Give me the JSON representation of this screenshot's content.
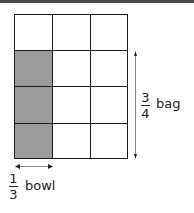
{
  "diagram": {
    "grid": {
      "rows": 4,
      "cols": 3,
      "shaded_cells": [
        [
          1,
          0
        ],
        [
          2,
          0
        ],
        [
          3,
          0
        ]
      ],
      "shade_color": "#9b9b9b",
      "line_color": "#1a1a1a"
    },
    "vertical_label": {
      "numerator": "3",
      "denominator": "4",
      "unit": "bag"
    },
    "horizontal_label": {
      "numerator": "1",
      "denominator": "3",
      "unit": "bowl"
    }
  }
}
